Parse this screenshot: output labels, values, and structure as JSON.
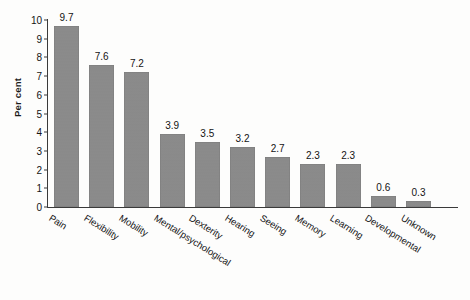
{
  "chart_data": {
    "type": "bar",
    "title": "",
    "xlabel": "",
    "ylabel": "Per cent",
    "ylim": [
      0,
      10
    ],
    "yticks": [
      "0",
      "1",
      "2",
      "3",
      "4",
      "5",
      "6",
      "7",
      "8",
      "9",
      "10"
    ],
    "grid": false,
    "legend": "none",
    "bar_color": "#8a8a8a",
    "categories": [
      "Pain",
      "Flexibility",
      "Mobility",
      "Mental/psychological",
      "Dexterity",
      "Hearing",
      "Seeing",
      "Memory",
      "Learning",
      "Developmental",
      "Unknown"
    ],
    "values": [
      9.7,
      7.6,
      7.2,
      3.9,
      3.5,
      3.2,
      2.7,
      2.3,
      2.3,
      0.6,
      0.3
    ],
    "value_labels": [
      "9.7",
      "7.6",
      "7.2",
      "3.9",
      "3.5",
      "3.2",
      "2.7",
      "2.3",
      "2.3",
      "0.6",
      "0.3"
    ]
  }
}
